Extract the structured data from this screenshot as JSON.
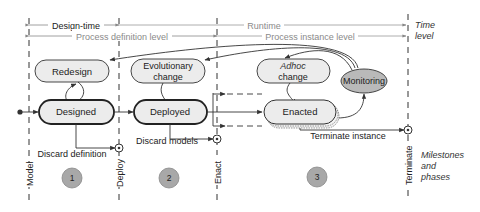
{
  "time_level": {
    "design_time": "Design-time",
    "runtime": "Runtime",
    "process_definition_level": "Process definition level",
    "process_instance_level": "Process instance level",
    "legend_label_line1": "Time",
    "legend_label_line2": "level"
  },
  "states": {
    "redesign": "Redesign",
    "evolutionary_change_line1": "Evolutionary",
    "evolutionary_change_line2": "change",
    "adhoc_change_line1": "Adhoc",
    "adhoc_change_line2": "change",
    "monitoring": "Monitoring",
    "designed": "Designed",
    "deployed": "Deployed",
    "enacted": "Enacted"
  },
  "transitions": {
    "discard_definition": "Discard definition",
    "discard_models": "Discard models",
    "terminate_instance": "Terminate instance"
  },
  "milestones": {
    "model": "Model",
    "deploy": "Deploy",
    "enact": "Enact",
    "terminate": "Terminate",
    "legend_line1": "Milestones",
    "legend_line2": "and",
    "legend_line3": "phases"
  },
  "phases": [
    "1",
    "2",
    "3"
  ],
  "colors": {
    "state_fill": "#ececec",
    "monitoring_fill": "#b9b9b9",
    "phase_fill": "#a8a8a8",
    "line": "#333333",
    "grey_text": "#8a8a8a"
  }
}
